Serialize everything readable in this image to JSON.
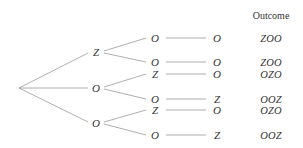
{
  "header": {
    "outcome_label": "Outcome"
  },
  "colors": {
    "line": "#9a9a9a",
    "text": "#333333",
    "background": "#ffffff"
  },
  "tree": {
    "root": {
      "x": 19,
      "y": 88
    },
    "level1": [
      {
        "label": "Z",
        "x": 96,
        "y": 52
      },
      {
        "label": "O",
        "x": 96,
        "y": 88
      },
      {
        "label": "O",
        "x": 96,
        "y": 123
      }
    ],
    "branches": [
      {
        "parent": 0,
        "second": "O",
        "third": "O",
        "outcome": "ZOO",
        "y": 38
      },
      {
        "parent": 0,
        "second": "O",
        "third": "O",
        "outcome": "ZOO",
        "y": 62
      },
      {
        "parent": 1,
        "second": "Z",
        "third": "O",
        "outcome": "OZO",
        "y": 74
      },
      {
        "parent": 1,
        "second": "O",
        "third": "Z",
        "outcome": "OOZ",
        "y": 99
      },
      {
        "parent": 2,
        "second": "Z",
        "third": "O",
        "outcome": "OZO",
        "y": 110
      },
      {
        "parent": 2,
        "second": "O",
        "third": "Z",
        "outcome": "OOZ",
        "y": 135
      }
    ],
    "columns": {
      "second_x": 155,
      "third_x": 217,
      "outcome_x": 271
    }
  }
}
